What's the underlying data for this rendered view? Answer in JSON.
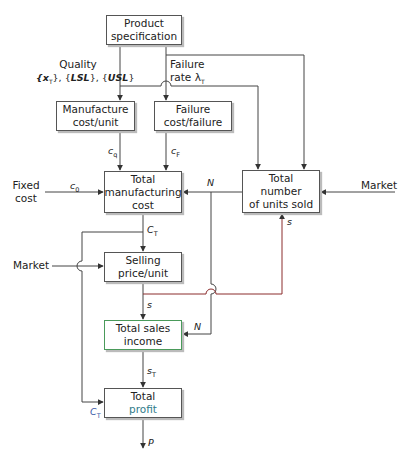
{
  "diagram": {
    "boxes": {
      "product_spec": {
        "line1": "Product",
        "line2": "specification"
      },
      "manufacture_cost": {
        "line1": "Manufacture",
        "line2": "cost/unit"
      },
      "failure_cost": {
        "line1": "Failure",
        "line2": "cost/failure"
      },
      "total_mfg_cost": {
        "line1": "Total",
        "line2": "manufacturing",
        "line3": "cost"
      },
      "total_units_sold": {
        "line1": "Total",
        "line2": "number",
        "line3": "of units sold"
      },
      "selling_price": {
        "line1": "Selling",
        "line2": "price/unit"
      },
      "total_sales_income": {
        "line1": "Total sales",
        "line2": "income"
      },
      "total_profit": {
        "line1": "Total",
        "line2": "profit"
      }
    },
    "labels": {
      "quality_title": "Quality",
      "quality_x": "{x",
      "quality_x_sub": "T",
      "quality_rest_1": "}, {",
      "quality_lsl": "LSL",
      "quality_rest_2": "}, {",
      "quality_usl": "USL",
      "quality_rest_3": "}",
      "failure_rate_1": "Failure",
      "failure_rate_2": "rate λ",
      "failure_rate_sub": "T",
      "fixed_cost_1": "Fixed",
      "fixed_cost_2": "cost",
      "market_right": "Market",
      "market_left": "Market"
    },
    "variables": {
      "cq": "c",
      "cq_sub": "q",
      "cf": "c",
      "cf_sub": "F",
      "c0": "c",
      "c0_sub": "0",
      "n_top": "N",
      "n_bottom": "N",
      "s_units": "s",
      "ct_top": "C",
      "ct_top_sub": "T",
      "s_mid": "s",
      "st": "s",
      "st_sub": "T",
      "ct_bottom": "C",
      "ct_bottom_sub": "T",
      "p": "P"
    },
    "colors": {
      "line": "#444444",
      "red_line": "#8b2c2c",
      "green_border": "#4a9a5a",
      "blue_label": "#3b5ba8"
    }
  }
}
